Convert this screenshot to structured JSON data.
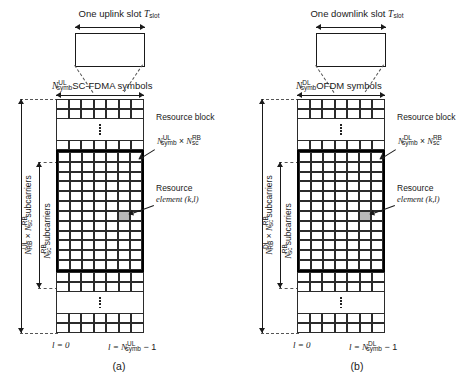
{
  "figure": {
    "caption_a": "(a)",
    "caption_b": "(b)"
  },
  "panels": [
    {
      "id": "uplink",
      "slot_title_text": "One uplink slot ",
      "slot_title_symbol": "T",
      "slot_title_sub": "slot",
      "symbols_label_N": "N",
      "symbols_label_sup": "UL",
      "symbols_label_sub": "symb",
      "symbols_label_text": "SC-FDMA symbols",
      "resource_block_label": "Resource block",
      "rb_size_N1": "N",
      "rb_size_sup1": "UL",
      "rb_size_sub1": "symb",
      "rb_size_times": "×",
      "rb_size_N2": "N",
      "rb_size_sup2": "RB",
      "rb_size_sub2": "sc",
      "resource_element_label_line1": "Resource",
      "resource_element_label_line2": "element (k,l)",
      "outer_axis_N1": "N",
      "outer_axis_sup1": "UL",
      "outer_axis_sub1": "RB",
      "outer_axis_times": "×",
      "outer_axis_N2": "N",
      "outer_axis_sup2": "RB",
      "outer_axis_sub2": "sc",
      "outer_axis_text": "subcarriers",
      "inner_axis_N": "N",
      "inner_axis_sup": "RB",
      "inner_axis_sub": "sc",
      "inner_axis_text": "subcarriers",
      "bottom_left": "l = 0",
      "bottom_right_l": "l = ",
      "bottom_right_N": "N",
      "bottom_right_sup": "UL",
      "bottom_right_sub": "symb",
      "bottom_right_tail": " − 1"
    },
    {
      "id": "downlink",
      "slot_title_text": "One downlink slot ",
      "slot_title_symbol": "T",
      "slot_title_sub": "slot",
      "symbols_label_N": "N",
      "symbols_label_sup": "DL",
      "symbols_label_sub": "symb",
      "symbols_label_text": "OFDM symbols",
      "resource_block_label": "Resource block",
      "rb_size_N1": "N",
      "rb_size_sup1": "DL",
      "rb_size_sub1": "symb",
      "rb_size_times": "×",
      "rb_size_N2": "N",
      "rb_size_sup2": "RB",
      "rb_size_sub2": "sc",
      "resource_element_label_line1": "Resource",
      "resource_element_label_line2": "element (k,l)",
      "outer_axis_N1": "N",
      "outer_axis_sup1": "DL",
      "outer_axis_sub1": "RB",
      "outer_axis_times": "×",
      "outer_axis_N2": "N",
      "outer_axis_sup2": "RB",
      "outer_axis_sub2": "sc",
      "outer_axis_text": "subcarriers",
      "inner_axis_N": "N",
      "inner_axis_sup": "RB",
      "inner_axis_sub": "sc",
      "inner_axis_text": "subcarriers",
      "bottom_left": "l = 0",
      "bottom_right_l": "l = ",
      "bottom_right_N": "N",
      "bottom_right_sup": "DL",
      "bottom_right_sub": "symb",
      "bottom_right_tail": " − 1"
    }
  ],
  "grid": {
    "columns": 7,
    "top_rows": 2,
    "mid_rows": 1,
    "rb_rows": 12,
    "after_rb_rows": 2,
    "bottom_rows": 2,
    "shaded_cell_row": 7,
    "shaded_cell_col": 6,
    "shaded_color": "#b9b9b9",
    "line_color": "#2b2b2b",
    "rb_border_color": "#000000"
  }
}
